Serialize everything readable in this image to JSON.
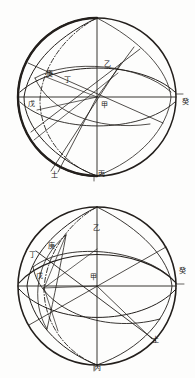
{
  "document": {
    "title": "两球面投影图",
    "page_background": "#fdfdfc",
    "ink_color": "#231f1c"
  },
  "figures": [
    {
      "id": "figure-top",
      "name": "upper-sphere-diagram",
      "caption": "",
      "circle": {
        "cx": 97,
        "cy": 97,
        "r": 79
      },
      "labels": [
        {
          "key": "top-left-stem",
          "text": "庚",
          "x": 46,
          "y": 76
        },
        {
          "key": "inner-left",
          "text": "丁",
          "x": 64,
          "y": 82
        },
        {
          "key": "upper-right-stem",
          "text": "乙",
          "x": 104,
          "y": 66
        },
        {
          "key": "left-pole",
          "text": "戊",
          "x": 28,
          "y": 106
        },
        {
          "key": "center",
          "text": "甲",
          "x": 101,
          "y": 107
        },
        {
          "key": "right-edge",
          "text": "癸",
          "x": 182,
          "y": 104
        },
        {
          "key": "bottom-left",
          "text": "土",
          "x": 51,
          "y": 177
        },
        {
          "key": "bottom-center",
          "text": "丙",
          "x": 98,
          "y": 176
        }
      ]
    },
    {
      "id": "figure-bottom",
      "name": "lower-sphere-diagram",
      "caption": "",
      "circle": {
        "cx": 97,
        "cy": 97,
        "r": 79
      },
      "labels": [
        {
          "key": "outer-left",
          "text": "丁",
          "x": 29,
          "y": 68
        },
        {
          "key": "inner-left-stem",
          "text": "庚",
          "x": 48,
          "y": 59
        },
        {
          "key": "upper-right-stem",
          "text": "乙",
          "x": 93,
          "y": 41
        },
        {
          "key": "left-pole",
          "text": "戊",
          "x": 36,
          "y": 89
        },
        {
          "key": "center",
          "text": "甲",
          "x": 90,
          "y": 90
        },
        {
          "key": "right-edge",
          "text": "癸",
          "x": 179,
          "y": 84
        },
        {
          "key": "lower-right",
          "text": "土",
          "x": 152,
          "y": 153
        },
        {
          "key": "bottom-center",
          "text": "丙",
          "x": 94,
          "y": 181
        }
      ]
    }
  ]
}
